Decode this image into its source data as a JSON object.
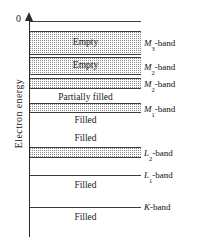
{
  "figure": {
    "axis": {
      "title": "Electron energy",
      "zero_tick": "0",
      "arrow_icon": "up-arrow-icon",
      "direction": "up"
    },
    "band_text": {
      "empty": "Empty",
      "partially_filled": "Partially filled",
      "filled": "Filled"
    },
    "bands": [
      {
        "id": "m3",
        "label_main": "M",
        "label_sub": "3",
        "label_suffix": "-band",
        "fill_text": "Empty",
        "fill_state": "empty",
        "shaded": true
      },
      {
        "id": "m2",
        "label_main": "M",
        "label_sub": "2",
        "label_suffix": "-band",
        "fill_text": "Empty",
        "fill_state": "empty",
        "shaded": true
      },
      {
        "id": "m2b",
        "label_main": "M",
        "label_sub": "2",
        "label_suffix": "-band",
        "fill_text": "",
        "fill_state": "empty",
        "shaded": true
      },
      {
        "id": "m1",
        "label_main": "M",
        "label_sub": "1",
        "label_suffix": "-band",
        "fill_text": "Partially filled",
        "fill_state": "partially-filled",
        "shaded": true
      },
      {
        "id": "l2",
        "label_main": "L",
        "label_sub": "2",
        "label_suffix": "-band",
        "fill_text": "Filled",
        "fill_state": "filled",
        "shaded": true
      },
      {
        "id": "l1",
        "label_main": "L",
        "label_sub": "1",
        "label_suffix": "-band",
        "fill_text": "Filled",
        "fill_state": "filled",
        "shaded": false
      },
      {
        "id": "k",
        "label_main": "K",
        "label_sub": "",
        "label_suffix": "-band",
        "fill_text": "Filled",
        "fill_state": "filled",
        "shaded": false
      }
    ],
    "inner_labels": [
      "Empty",
      "Empty",
      "Partially filled",
      "Filled",
      "Filled",
      "Filled",
      "Filled"
    ],
    "colors": {
      "line": "#3a3a3a",
      "axis": "#2b2b2b",
      "stipple": "#8d8d8d",
      "background": "#ffffff",
      "text": "#1a1a1a"
    }
  }
}
